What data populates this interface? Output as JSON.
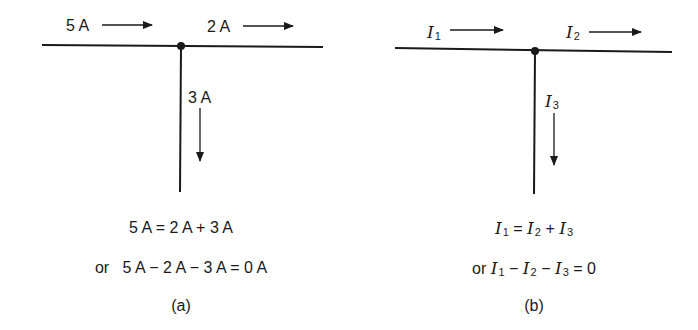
{
  "panels": [
    {
      "id": "a",
      "currents": {
        "in_left": "5 A",
        "out_right": "2 A",
        "out_down": "3 A"
      },
      "equations": {
        "line1": "5 A = 2 A + 3 A",
        "line2_prefix": "or",
        "line2": "5 A − 2 A − 3 A = 0 A"
      },
      "caption": "(a)"
    },
    {
      "id": "b",
      "currents": {
        "in_left": {
          "symbol": "I",
          "sub": "1"
        },
        "out_right": {
          "symbol": "I",
          "sub": "2"
        },
        "out_down": {
          "symbol": "I",
          "sub": "3"
        }
      },
      "equations": {
        "line1": {
          "lhs": {
            "symbol": "I",
            "sub": "1"
          },
          "eq": "=",
          "t1": {
            "symbol": "I",
            "sub": "2"
          },
          "op": "+",
          "t2": {
            "symbol": "I",
            "sub": "3"
          }
        },
        "line2_prefix": "or",
        "line2": {
          "t1": {
            "symbol": "I",
            "sub": "1"
          },
          "op1": "−",
          "t2": {
            "symbol": "I",
            "sub": "2"
          },
          "op2": "−",
          "t3": {
            "symbol": "I",
            "sub": "3"
          },
          "eq": "=",
          "rhs": "0"
        }
      },
      "caption": "(b)"
    }
  ],
  "colors": {
    "ink": "#1a1a1a",
    "background": "#ffffff"
  }
}
